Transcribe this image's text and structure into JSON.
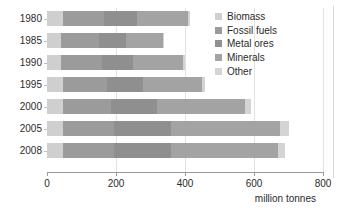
{
  "chart_data": {
    "type": "bar",
    "orientation": "horizontal",
    "stacked": true,
    "title": "",
    "xlabel": "million tonnes",
    "ylabel": "",
    "categories": [
      "1980",
      "1985",
      "1990",
      "1995",
      "2000",
      "2005",
      "2008"
    ],
    "xticks": [
      0,
      200,
      400,
      600,
      800
    ],
    "xlim": [
      0,
      800
    ],
    "grid": true,
    "legend_position": "top-right",
    "series": [
      {
        "name": "Biomass",
        "color": "#cfcfcf",
        "values": [
          45,
          42,
          42,
          45,
          45,
          45,
          45
        ]
      },
      {
        "name": "Fossil fuels",
        "color": "#9b9b9b",
        "values": [
          120,
          108,
          118,
          128,
          140,
          150,
          150
        ]
      },
      {
        "name": "Metal ores",
        "color": "#8f8f8f",
        "values": [
          95,
          80,
          90,
          105,
          135,
          165,
          165
        ]
      },
      {
        "name": "Minerals",
        "color": "#a3a3a3",
        "values": [
          150,
          105,
          145,
          170,
          255,
          315,
          310
        ]
      },
      {
        "name": "Other",
        "color": "#d4d4d4",
        "values": [
          5,
          5,
          5,
          10,
          15,
          25,
          20
        ]
      }
    ],
    "totals": [
      415,
      340,
      400,
      458,
      590,
      700,
      690
    ]
  },
  "axis": {
    "xlabel": "million tonnes",
    "tick_labels": [
      "0",
      "200",
      "400",
      "600",
      "800"
    ],
    "category_labels": [
      "1980",
      "1985",
      "1990",
      "1995",
      "2000",
      "2005",
      "2008"
    ]
  },
  "legend": {
    "items": [
      {
        "label": "Biomass",
        "color": "#cfcfcf"
      },
      {
        "label": "Fossil fuels",
        "color": "#9b9b9b"
      },
      {
        "label": "Metal ores",
        "color": "#8f8f8f"
      },
      {
        "label": "Minerals",
        "color": "#a3a3a3"
      },
      {
        "label": "Other",
        "color": "#d4d4d4"
      }
    ]
  },
  "colors": {
    "background": "#ffffff",
    "axis": "#9a9a9a",
    "grid": "#e2e2e2",
    "text": "#2b2b2b"
  }
}
